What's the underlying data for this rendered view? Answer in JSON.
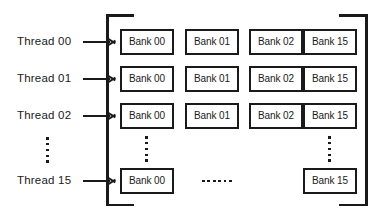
{
  "diagram": {
    "colors": {
      "ink": "#1a1a1a",
      "background": "#ffffff"
    },
    "threads": [
      {
        "label": "Thread 00"
      },
      {
        "label": "Thread 01"
      },
      {
        "label": "Thread 02"
      },
      {
        "label": "Thread 15"
      }
    ],
    "thread_column_ellipsis": {
      "dots": 5
    },
    "rows": [
      {
        "thread": "Thread 00",
        "banks": [
          "Bank 00",
          "Bank 01",
          "Bank 02",
          "Bank 15"
        ],
        "has_row_ellipsis": true
      },
      {
        "thread": "Thread 01",
        "banks": [
          "Bank 00",
          "Bank 01",
          "Bank 02",
          "Bank 15"
        ],
        "has_row_ellipsis": true
      },
      {
        "thread": "Thread 02",
        "banks": [
          "Bank 00",
          "Bank 01",
          "Bank 02",
          "Bank 15"
        ],
        "has_row_ellipsis": true
      },
      {
        "thread": "Thread 15",
        "banks": [
          "Bank 00",
          "Bank 15"
        ],
        "has_row_ellipsis": true
      }
    ],
    "row_ellipsis": {
      "dots": 6
    },
    "column_ellipsis": {
      "dots": 5
    },
    "bank_labels": {
      "r0c0": "Bank 00",
      "r0c1": "Bank 01",
      "r0c2": "Bank 02",
      "r0c3": "Bank 15",
      "r1c0": "Bank 00",
      "r1c1": "Bank 01",
      "r1c2": "Bank 02",
      "r1c3": "Bank 15",
      "r2c0": "Bank 00",
      "r2c1": "Bank 01",
      "r2c2": "Bank 02",
      "r2c3": "Bank 15",
      "r3c0": "Bank 00",
      "r3c3": "Bank 15"
    }
  }
}
